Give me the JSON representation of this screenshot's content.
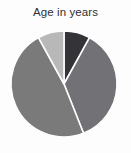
{
  "chart_data": {
    "type": "pie",
    "title": "Age in years",
    "xlabel": "",
    "ylabel": "",
    "legend": false,
    "legend_position": "none",
    "grid": false,
    "labels": [
      "Slice 1",
      "Slice 2",
      "Slice 3",
      "Slice 4"
    ],
    "values": [
      8,
      36,
      48,
      8
    ],
    "colors": [
      "#333338",
      "#727276",
      "#7a7a7a",
      "#b8b8b8"
    ],
    "start_angle_deg": 0,
    "direction": "clockwise",
    "slice_separator_color": "#fdfdfd",
    "slices": [
      {
        "label": "Slice 1",
        "value": 8,
        "percent": 8,
        "color": "#333338",
        "start_deg": 0,
        "end_deg": 28.8
      },
      {
        "label": "Slice 2",
        "value": 36,
        "percent": 36,
        "color": "#727276",
        "start_deg": 28.8,
        "end_deg": 158.4
      },
      {
        "label": "Slice 3",
        "value": 48,
        "percent": 48,
        "color": "#7a7a7a",
        "start_deg": 158.4,
        "end_deg": 331.2
      },
      {
        "label": "Slice 4",
        "value": 8,
        "percent": 8,
        "color": "#b8b8b8",
        "start_deg": 331.2,
        "end_deg": 360
      }
    ],
    "geometry": {
      "center_x": 64,
      "center_y": 84,
      "radius": 53
    }
  },
  "figure": {
    "background_color": "#fdfdfd",
    "title_color": "#2f2f33"
  }
}
